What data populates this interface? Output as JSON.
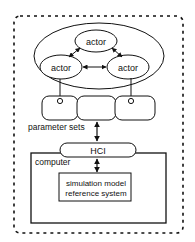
{
  "diagram": {
    "actors": [
      {
        "id": "actor-top",
        "label": "actor"
      },
      {
        "id": "actor-left",
        "label": "actor"
      },
      {
        "id": "actor-right",
        "label": "actor"
      }
    ],
    "parameter_sets": {
      "label": "parameter sets",
      "count": 3
    },
    "hci": {
      "label": "HCI"
    },
    "computer": {
      "label": "computer"
    },
    "simulation": {
      "line1": "simulation model",
      "line2": "reference system"
    },
    "colors": {
      "stroke": "#111111",
      "background": "#ffffff"
    }
  }
}
